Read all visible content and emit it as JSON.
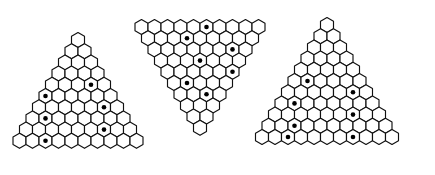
{
  "figure": {
    "background_color": "#ffffff",
    "line_color": "#111111",
    "cell_fill_color": "#ffffff",
    "marker_color": "#000000",
    "width": 435,
    "height": 175,
    "hex_width": 13.0,
    "hex_row_step": 11.2,
    "marker_radius": 2.3
  },
  "diagrams": [
    {
      "id": "left-triangle",
      "name": "left-triangle",
      "orientation": "up",
      "rows": 10,
      "apex_x": 78.0,
      "apex_y": 40.0,
      "row_counts": [
        1,
        2,
        3,
        4,
        5,
        6,
        7,
        8,
        9,
        10
      ],
      "marked_cells": [
        {
          "row": 5,
          "col": 4
        },
        {
          "row": 6,
          "col": 1
        },
        {
          "row": 7,
          "col": 6
        },
        {
          "row": 8,
          "col": 2
        },
        {
          "row": 9,
          "col": 7
        },
        {
          "row": 10,
          "col": 3
        }
      ],
      "marked_count": 6
    },
    {
      "id": "middle-triangle",
      "name": "middle-triangle",
      "orientation": "down",
      "rows": 10,
      "apex_x": 200.0,
      "apex_y": 27.0,
      "row_counts": [
        10,
        9,
        8,
        7,
        6,
        5,
        4,
        3,
        2,
        1
      ],
      "marked_cells": [
        {
          "row": 1,
          "col": 6
        },
        {
          "row": 2,
          "col": 4
        },
        {
          "row": 3,
          "col": 7
        },
        {
          "row": 4,
          "col": 4
        },
        {
          "row": 5,
          "col": 6
        },
        {
          "row": 6,
          "col": 2
        },
        {
          "row": 7,
          "col": 3
        }
      ],
      "marked_count": 7
    },
    {
      "id": "right-triangle",
      "name": "right-triangle",
      "orientation": "up",
      "rows": 11,
      "apex_x": 327.0,
      "apex_y": 25.0,
      "row_counts": [
        1,
        2,
        3,
        4,
        5,
        6,
        7,
        8,
        9,
        10,
        11
      ],
      "marked_cells": [
        {
          "row": 6,
          "col": 2
        },
        {
          "row": 7,
          "col": 6
        },
        {
          "row": 8,
          "col": 2
        },
        {
          "row": 9,
          "col": 7
        },
        {
          "row": 10,
          "col": 3
        },
        {
          "row": 11,
          "col": 8
        },
        {
          "row": 11,
          "col": 3
        }
      ],
      "marked_count": 7
    }
  ]
}
